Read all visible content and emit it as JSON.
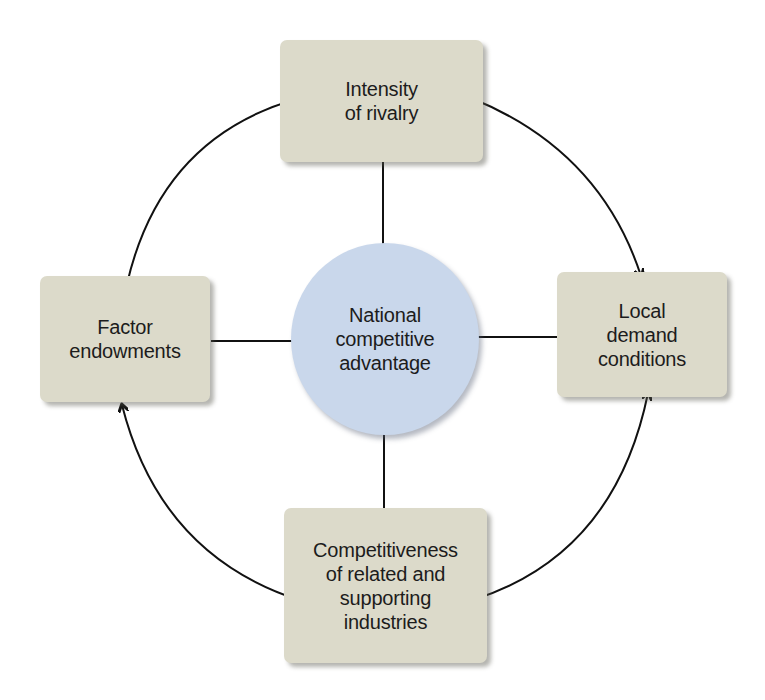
{
  "diagram": {
    "type": "porter-diamond",
    "center": {
      "label": "National\ncompetitive\nadvantage",
      "fill_color": "#c9d7eb"
    },
    "nodes": [
      {
        "id": "top",
        "label": "Intensity\nof rivalry"
      },
      {
        "id": "left",
        "label": "Factor\nendowments"
      },
      {
        "id": "right",
        "label": "Local\ndemand\nconditions"
      },
      {
        "id": "bottom",
        "label": "Competitiveness\nof related and\nsupporting\nindustries"
      }
    ],
    "node_fill_color": "#dcdaca",
    "edges": [
      {
        "from": "top",
        "to": "center",
        "direction": "one-way"
      },
      {
        "from": "left",
        "to": "center",
        "direction": "one-way"
      },
      {
        "from": "right",
        "to": "center",
        "direction": "one-way"
      },
      {
        "from": "bottom",
        "to": "center",
        "direction": "one-way"
      },
      {
        "from": "top",
        "to": "left",
        "direction": "two-way",
        "style": "curved"
      },
      {
        "from": "top",
        "to": "right",
        "direction": "two-way",
        "style": "curved"
      },
      {
        "from": "left",
        "to": "bottom",
        "direction": "two-way",
        "style": "curved"
      },
      {
        "from": "right",
        "to": "bottom",
        "direction": "two-way",
        "style": "curved"
      }
    ]
  }
}
